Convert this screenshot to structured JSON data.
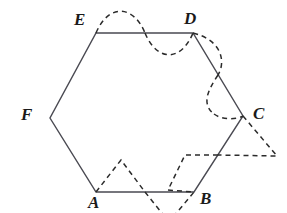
{
  "figure": {
    "background_color": "#ffffff",
    "solid_stroke_color": "#4a4a52",
    "dashed_stroke_color": "#2b2b2b",
    "label_color": "#1a1a1a",
    "solid_stroke_width": 1.4,
    "dashed_stroke_width": 1.5,
    "dash_pattern": "5,4",
    "hexagon": {
      "name": "hexagon-ABCDEF",
      "vertices": [
        {
          "label": "A",
          "x": 96,
          "y": 192,
          "label_x": 88,
          "label_y": 194
        },
        {
          "label": "B",
          "x": 194,
          "y": 192,
          "label_x": 200,
          "label_y": 190
        },
        {
          "label": "C",
          "x": 243,
          "y": 116,
          "label_x": 253,
          "label_y": 105
        },
        {
          "label": "D",
          "x": 193,
          "y": 33,
          "label_x": 184,
          "label_y": 10
        },
        {
          "label": "E",
          "x": 96,
          "y": 33,
          "label_x": 74,
          "label_y": 11
        },
        {
          "label": "F",
          "x": 50,
          "y": 118,
          "label_x": 21,
          "label_y": 106
        }
      ],
      "edges": [
        "AB",
        "BC",
        "CD",
        "DE",
        "EF",
        "FA"
      ]
    },
    "overlays": [
      {
        "name": "dashed-sine-wave-top-ED",
        "type": "sine-wave",
        "along_edge": "ED",
        "description": "dashed sinusoid over the top edge from E to D, crest above then trough below"
      },
      {
        "name": "dashed-sine-wave-right-DC",
        "type": "sine-wave",
        "along_edge": "DC",
        "description": "dashed sinusoid over edge D to C, bulging right then left"
      },
      {
        "name": "dashed-zigzag-bottom-AB",
        "type": "zigzag",
        "along_edge": "AB",
        "description": "dashed triangular zigzag over the bottom edge from A to B, peak up then peak down"
      },
      {
        "name": "dashed-zigzag-right-CB",
        "type": "zigzag",
        "along_edge": "CB",
        "description": "dashed triangular zigzag over edge C to B, peak right then peak left"
      }
    ]
  }
}
